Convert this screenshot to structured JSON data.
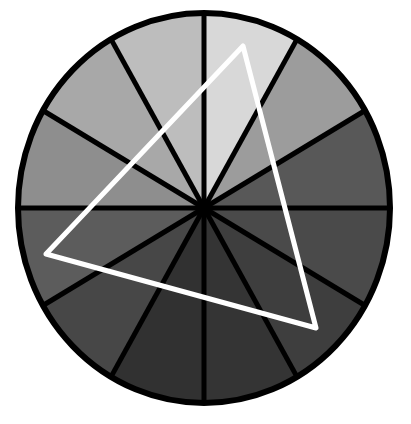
{
  "diagram": {
    "type": "color-wheel-triad",
    "wheel": {
      "center": [
        204,
        208
      ],
      "rx": 186,
      "ry": 195,
      "segment_count": 12,
      "outline_color": "#000000",
      "outline_width": 5,
      "segments": [
        {
          "index": 0,
          "start_deg": 0,
          "end_deg": 30,
          "color": "#d8d8d8"
        },
        {
          "index": 1,
          "start_deg": 30,
          "end_deg": 60,
          "color": "#9c9c9c"
        },
        {
          "index": 2,
          "start_deg": 60,
          "end_deg": 90,
          "color": "#585858"
        },
        {
          "index": 3,
          "start_deg": 90,
          "end_deg": 120,
          "color": "#4a4a4a"
        },
        {
          "index": 4,
          "start_deg": 120,
          "end_deg": 150,
          "color": "#3e3e3e"
        },
        {
          "index": 5,
          "start_deg": 150,
          "end_deg": 180,
          "color": "#343434"
        },
        {
          "index": 6,
          "start_deg": 180,
          "end_deg": 210,
          "color": "#313131"
        },
        {
          "index": 7,
          "start_deg": 210,
          "end_deg": 240,
          "color": "#474747"
        },
        {
          "index": 8,
          "start_deg": 240,
          "end_deg": 270,
          "color": "#5c5c5c"
        },
        {
          "index": 9,
          "start_deg": 270,
          "end_deg": 300,
          "color": "#8e8e8e"
        },
        {
          "index": 10,
          "start_deg": 300,
          "end_deg": 330,
          "color": "#a8a8a8"
        },
        {
          "index": 11,
          "start_deg": 330,
          "end_deg": 360,
          "color": "#bdbdbd"
        }
      ]
    },
    "triangle": {
      "points": [
        [
          243,
          46
        ],
        [
          316,
          328
        ],
        [
          46,
          254
        ]
      ],
      "stroke_color": "#ffffff",
      "stroke_width": 5
    }
  }
}
